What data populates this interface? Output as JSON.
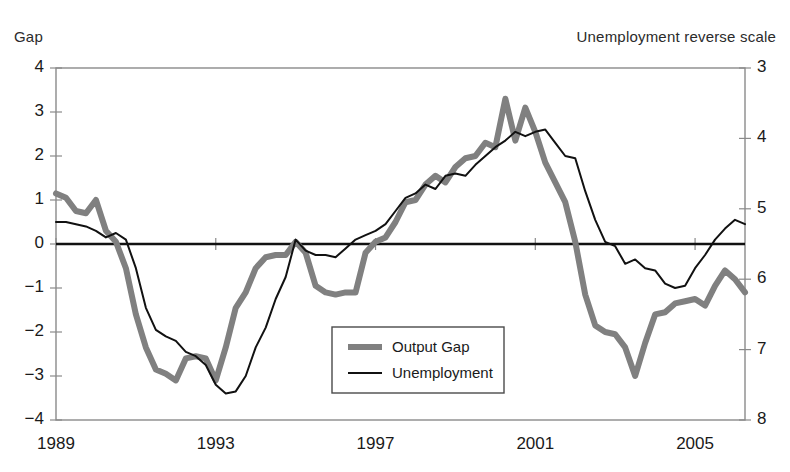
{
  "chart_data": {
    "type": "line",
    "title": "",
    "subtitle": "",
    "xlabel": "",
    "ylabel": "Gap",
    "y2label": "Unemployment reverse scale",
    "grid": false,
    "legend_position": "inside-center-bottom",
    "zero_line": true,
    "xlim": [
      1989.0,
      2006.25
    ],
    "ylim": [
      -4,
      4
    ],
    "y2lim_reversed": [
      8,
      3
    ],
    "xticks": [
      "1989",
      "1993",
      "1997",
      "2001",
      "2005"
    ],
    "xtick_values": [
      1989,
      1993,
      1997,
      2001,
      2005
    ],
    "yticks_left": [
      "4",
      "3",
      "2",
      "1",
      "0",
      "−1",
      "−2",
      "−3",
      "−4"
    ],
    "ytick_left_values": [
      4,
      3,
      2,
      1,
      0,
      -1,
      -2,
      -3,
      -4
    ],
    "yticks_right": [
      "3",
      "4",
      "5",
      "6",
      "7",
      "8"
    ],
    "ytick_right_values": [
      3,
      4,
      5,
      6,
      7,
      8
    ],
    "axis_note": "Right axis is unemployment plotted on a reverse scale; right value 5.5 aligns with left value 0.",
    "series": [
      {
        "name": "Output Gap",
        "axis": "left",
        "color": "#808080",
        "width": 6,
        "x": [
          1989.0,
          1989.25,
          1989.5,
          1989.75,
          1990.0,
          1990.25,
          1990.5,
          1990.75,
          1991.0,
          1991.25,
          1991.5,
          1991.75,
          1992.0,
          1992.25,
          1992.5,
          1992.75,
          1993.0,
          1993.25,
          1993.5,
          1993.75,
          1994.0,
          1994.25,
          1994.5,
          1994.75,
          1995.0,
          1995.25,
          1995.5,
          1995.75,
          1996.0,
          1996.25,
          1996.5,
          1996.75,
          1997.0,
          1997.25,
          1997.5,
          1997.75,
          1998.0,
          1998.25,
          1998.5,
          1998.75,
          1999.0,
          1999.25,
          1999.5,
          1999.75,
          2000.0,
          2000.25,
          2000.5,
          2000.75,
          2001.0,
          2001.25,
          2001.5,
          2001.75,
          2002.0,
          2002.25,
          2002.5,
          2002.75,
          2003.0,
          2003.25,
          2003.5,
          2003.75,
          2004.0,
          2004.25,
          2004.5,
          2004.75,
          2005.0,
          2005.25,
          2005.5,
          2005.75,
          2006.0,
          2006.25
        ],
        "y": [
          1.15,
          1.05,
          0.75,
          0.7,
          1.0,
          0.3,
          0.05,
          -0.55,
          -1.6,
          -2.35,
          -2.85,
          -2.95,
          -3.1,
          -2.6,
          -2.55,
          -2.6,
          -3.1,
          -2.35,
          -1.45,
          -1.1,
          -0.55,
          -0.3,
          -0.25,
          -0.25,
          0.05,
          -0.2,
          -0.95,
          -1.1,
          -1.15,
          -1.1,
          -1.1,
          -0.2,
          0.05,
          0.15,
          0.5,
          0.95,
          1.0,
          1.35,
          1.55,
          1.4,
          1.75,
          1.95,
          2.0,
          2.3,
          2.2,
          3.3,
          2.35,
          3.1,
          2.55,
          1.85,
          1.4,
          0.95,
          0.05,
          -1.15,
          -1.85,
          -2.0,
          -2.05,
          -2.35,
          -3.0,
          -2.25,
          -1.6,
          -1.55,
          -1.35,
          -1.3,
          -1.25,
          -1.4,
          -0.95,
          -0.6,
          -0.8,
          -1.1
        ]
      },
      {
        "name": "Unemployment",
        "axis": "right",
        "color": "#111111",
        "width": 2,
        "x": [
          1989.0,
          1989.25,
          1989.5,
          1989.75,
          1990.0,
          1990.25,
          1990.5,
          1990.75,
          1991.0,
          1991.25,
          1991.5,
          1991.75,
          1992.0,
          1992.25,
          1992.5,
          1992.75,
          1993.0,
          1993.25,
          1993.5,
          1993.75,
          1994.0,
          1994.25,
          1994.5,
          1994.75,
          1995.0,
          1995.25,
          1995.5,
          1995.75,
          1996.0,
          1996.25,
          1996.5,
          1996.75,
          1997.0,
          1997.25,
          1997.5,
          1997.75,
          1998.0,
          1998.25,
          1998.5,
          1998.75,
          1999.0,
          1999.25,
          1999.5,
          1999.75,
          2000.0,
          2000.25,
          2000.5,
          2000.75,
          2001.0,
          2001.25,
          2001.5,
          2001.75,
          2002.0,
          2002.25,
          2002.5,
          2002.75,
          2003.0,
          2003.25,
          2003.5,
          2003.75,
          2004.0,
          2004.25,
          2004.5,
          2004.75,
          2005.0,
          2005.25,
          2005.5,
          2005.75,
          2006.0,
          2006.25
        ],
        "y_left_equiv": [
          0.5,
          0.5,
          0.45,
          0.4,
          0.3,
          0.15,
          0.25,
          0.1,
          -0.55,
          -1.45,
          -1.95,
          -2.1,
          -2.2,
          -2.45,
          -2.55,
          -2.75,
          -3.2,
          -3.4,
          -3.35,
          -3.0,
          -2.35,
          -1.9,
          -1.25,
          -0.75,
          0.1,
          -0.15,
          -0.25,
          -0.25,
          -0.3,
          -0.1,
          0.1,
          0.2,
          0.3,
          0.45,
          0.75,
          1.05,
          1.15,
          1.35,
          1.25,
          1.55,
          1.6,
          1.55,
          1.8,
          2.0,
          2.2,
          2.35,
          2.55,
          2.45,
          2.55,
          2.6,
          2.3,
          2.0,
          1.95,
          1.2,
          0.55,
          0.05,
          -0.05,
          -0.45,
          -0.35,
          -0.55,
          -0.6,
          -0.9,
          -1.0,
          -0.95,
          -0.55,
          -0.25,
          0.1,
          0.35,
          0.55,
          0.45
        ],
        "y_unemployment_rate": [
          5.0,
          5.0,
          5.05,
          5.1,
          5.2,
          5.35,
          5.25,
          5.4,
          6.05,
          6.95,
          7.45,
          7.6,
          7.7,
          7.95,
          8.05,
          8.25,
          8.7,
          8.9,
          8.85,
          8.5,
          7.85,
          7.4,
          6.75,
          6.25,
          5.4,
          5.65,
          5.75,
          5.75,
          5.8,
          5.6,
          5.4,
          5.3,
          5.2,
          5.05,
          4.75,
          4.45,
          4.35,
          4.15,
          4.25,
          3.95,
          3.9,
          3.95,
          3.7,
          3.5,
          3.3,
          3.15,
          2.95,
          3.05,
          2.95,
          2.9,
          3.2,
          3.5,
          3.55,
          4.3,
          4.95,
          5.45,
          5.55,
          5.95,
          5.85,
          6.05,
          6.1,
          6.4,
          6.5,
          6.45,
          6.05,
          5.75,
          5.4,
          5.15,
          4.95,
          5.05
        ]
      }
    ],
    "legend": [
      {
        "label": "Output Gap",
        "color": "#808080",
        "width": 6
      },
      {
        "label": "Unemployment",
        "color": "#111111",
        "width": 2
      }
    ]
  },
  "labels": {
    "gap_title": "Gap",
    "unemployment_title": "Unemployment reverse scale"
  }
}
